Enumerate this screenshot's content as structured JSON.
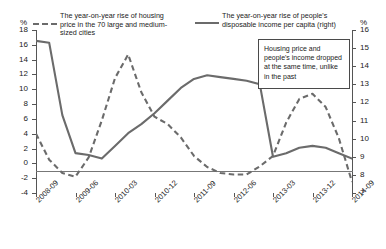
{
  "axes": {
    "left_unit": "%",
    "right_unit": "%",
    "left_ticks": [
      "18",
      "16",
      "14",
      "12",
      "10",
      "8",
      "6",
      "4",
      "2",
      "0",
      "-2",
      "-4"
    ],
    "right_ticks": [
      "16",
      "15",
      "14",
      "13",
      "12",
      "11",
      "10",
      "9",
      "8",
      "7"
    ],
    "x_ticks": [
      "2008-09",
      "2009-06",
      "2010-03",
      "2010-12",
      "2011-09",
      "2012-06",
      "2013-03",
      "2013-12",
      "2014-09"
    ]
  },
  "legend": {
    "series1": "The year-on-year rise of housing price in the 70 large and medium-sized cities",
    "series2": "The year-on-year rise of people's disposable income per capita (right)"
  },
  "annotation": {
    "text": "Housing price and people's income dropped at the same time, unlike in the past"
  },
  "colors": {
    "line": "#6b6b6b",
    "axis": "#555555",
    "text": "#222222",
    "background": "#ffffff"
  },
  "chart_data": {
    "type": "line",
    "title": "",
    "xlabel": "",
    "ylabel": "%",
    "ylim": [
      -4,
      18
    ],
    "y2lim": [
      7,
      16
    ],
    "grid": false,
    "legend_position": "top",
    "x": [
      "2008-09",
      "2008-12",
      "2009-03",
      "2009-06",
      "2009-09",
      "2009-12",
      "2010-03",
      "2010-06",
      "2010-09",
      "2010-12",
      "2011-03",
      "2011-06",
      "2011-09",
      "2011-12",
      "2012-03",
      "2012-06",
      "2012-09",
      "2012-12",
      "2013-03",
      "2013-06",
      "2013-09",
      "2013-12",
      "2014-03",
      "2014-06",
      "2014-09"
    ],
    "series": [
      {
        "name": "The year-on-year rise of housing price in the 70 large and medium-sized cities",
        "axis": "left",
        "style": "dashed",
        "values": [
          4.0,
          0.5,
          -1.3,
          -1.8,
          0.8,
          5.8,
          11.5,
          14.7,
          9.6,
          6.3,
          5.3,
          3.5,
          1.0,
          -0.5,
          -1.3,
          -1.5,
          -1.5,
          -0.4,
          1.0,
          5.5,
          8.7,
          9.4,
          7.6,
          3.4,
          -2.5
        ]
      },
      {
        "name": "The year-on-year rise of people's disposable income per capita (right)",
        "axis": "right",
        "style": "solid",
        "values": [
          15.4,
          15.3,
          11.3,
          9.2,
          9.1,
          8.9,
          9.6,
          10.3,
          10.8,
          11.4,
          12.1,
          12.8,
          13.3,
          13.5,
          13.4,
          13.3,
          13.2,
          13.0,
          9.0,
          9.2,
          9.5,
          9.6,
          9.5,
          9.2,
          8.9
        ]
      }
    ]
  }
}
